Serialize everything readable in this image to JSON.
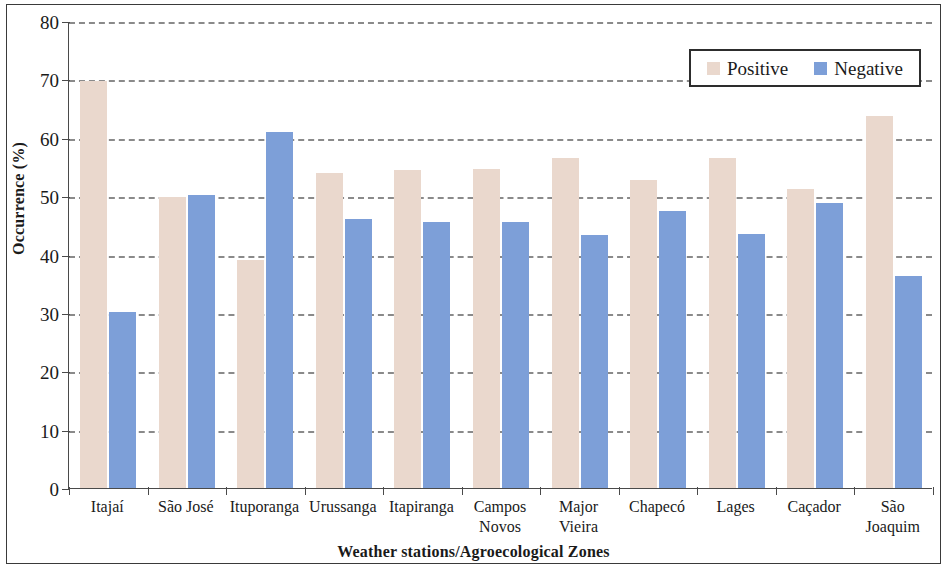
{
  "chart_data": {
    "type": "bar",
    "title": "",
    "subtitle": "",
    "xlabel": "Weather stations/Agroecological Zones",
    "ylabel": "Occurrence (%)",
    "ylim": [
      0,
      80
    ],
    "ytick_step": 10,
    "yticks": [
      "80",
      "70",
      "60",
      "50",
      "40",
      "30",
      "20",
      "10",
      "0"
    ],
    "grid": "horizontal-dashed",
    "legend_position": "top-right",
    "colors": {
      "positive": "#ead8cd",
      "negative": "#7d9fd8",
      "axis": "#4a4a4a",
      "grid": "#8a8a8a",
      "text": "#1a1a1a",
      "frame": "#3a3a3a"
    },
    "categories": [
      "Itajaí",
      "São José",
      "Ituporanga",
      "Urussanga",
      "Itapiranga",
      "Campos Novos",
      "Major Vieira",
      "Chapecó",
      "Lages",
      "Caçador",
      "São Joaquim"
    ],
    "series": [
      {
        "name": "Positive",
        "color": "#ead8cd",
        "values": [
          69.8,
          49.8,
          39.0,
          53.9,
          54.5,
          54.7,
          56.6,
          52.7,
          56.6,
          51.3,
          63.7
        ]
      },
      {
        "name": "Negative",
        "color": "#7d9fd8",
        "values": [
          30.2,
          50.2,
          61.0,
          46.1,
          45.5,
          45.6,
          43.4,
          47.5,
          43.5,
          48.9,
          36.3
        ]
      }
    ]
  },
  "legend": {
    "items": [
      {
        "label": "Positive",
        "swatch": "pos"
      },
      {
        "label": "Negative",
        "swatch": "neg"
      }
    ]
  }
}
